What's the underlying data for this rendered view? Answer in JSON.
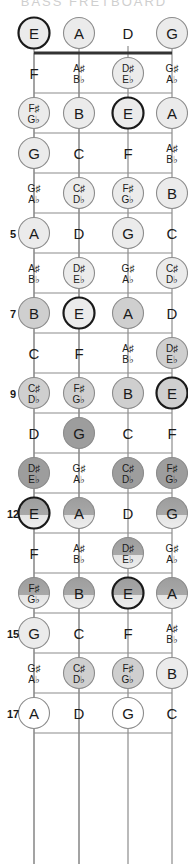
{
  "diagram": {
    "instrument": "4-string bass",
    "orientation": "vertical",
    "colors": {
      "background": "#ffffff",
      "fret_line": "#8c8c8c",
      "nut": "#333333",
      "string": "#8c8c8c",
      "text": "#1a1a1a",
      "circle_light": "#ebebeb",
      "circle_mid": "#cfcfcf",
      "circle_dark": "#9d9d9d",
      "circle_outline_strong": "#1a1a1a",
      "circle_outline_soft": "#8c8c8c"
    },
    "strings": [
      {
        "index": 0,
        "open_note": "E",
        "x": 34,
        "highlight": "strong"
      },
      {
        "index": 1,
        "open_note": "A",
        "x": 79,
        "highlight": "soft"
      },
      {
        "index": 2,
        "open_note": "D",
        "x": 128,
        "highlight": "none"
      },
      {
        "index": 3,
        "open_note": "G",
        "x": 172,
        "highlight": "soft"
      }
    ],
    "fret_markers": [
      "5",
      "7",
      "9",
      "12",
      "15",
      "17"
    ],
    "top_cut_label": "BASS FRETBOARD",
    "frets": [
      {
        "number": 0,
        "label": "",
        "y": 33,
        "notes": [
          {
            "string": 0,
            "text": "E",
            "sharp": "",
            "flat": "",
            "shade": "light",
            "ring": "strong"
          },
          {
            "string": 1,
            "text": "A",
            "sharp": "",
            "flat": "",
            "shade": "light",
            "ring": "soft"
          },
          {
            "string": 2,
            "text": "D",
            "sharp": "",
            "flat": "",
            "shade": "none",
            "ring": "none"
          },
          {
            "string": 3,
            "text": "G",
            "sharp": "",
            "flat": "",
            "shade": "light",
            "ring": "soft"
          }
        ]
      },
      {
        "number": 1,
        "label": "",
        "y": 73,
        "notes": [
          {
            "string": 0,
            "text": "F",
            "sharp": "",
            "flat": "",
            "shade": "none",
            "ring": "none"
          },
          {
            "string": 1,
            "text": "",
            "sharp": "A♯",
            "flat": "B♭",
            "shade": "none",
            "ring": "none"
          },
          {
            "string": 2,
            "text": "",
            "sharp": "D♯",
            "flat": "E♭",
            "shade": "light",
            "ring": "soft"
          },
          {
            "string": 3,
            "text": "",
            "sharp": "G♯",
            "flat": "A♭",
            "shade": "none",
            "ring": "none"
          }
        ]
      },
      {
        "number": 2,
        "label": "",
        "y": 113,
        "notes": [
          {
            "string": 0,
            "text": "",
            "sharp": "F♯",
            "flat": "G♭",
            "shade": "light",
            "ring": "soft"
          },
          {
            "string": 1,
            "text": "B",
            "sharp": "",
            "flat": "",
            "shade": "light",
            "ring": "soft"
          },
          {
            "string": 2,
            "text": "E",
            "sharp": "",
            "flat": "",
            "shade": "light",
            "ring": "strong"
          },
          {
            "string": 3,
            "text": "A",
            "sharp": "",
            "flat": "",
            "shade": "light",
            "ring": "soft"
          }
        ]
      },
      {
        "number": 3,
        "label": "",
        "y": 153,
        "notes": [
          {
            "string": 0,
            "text": "G",
            "sharp": "",
            "flat": "",
            "shade": "light",
            "ring": "soft"
          },
          {
            "string": 1,
            "text": "C",
            "sharp": "",
            "flat": "",
            "shade": "none",
            "ring": "none"
          },
          {
            "string": 2,
            "text": "F",
            "sharp": "",
            "flat": "",
            "shade": "none",
            "ring": "none"
          },
          {
            "string": 3,
            "text": "",
            "sharp": "A♯",
            "flat": "B♭",
            "shade": "none",
            "ring": "none"
          }
        ]
      },
      {
        "number": 4,
        "label": "",
        "y": 193,
        "notes": [
          {
            "string": 0,
            "text": "",
            "sharp": "G♯",
            "flat": "A♭",
            "shade": "none",
            "ring": "none"
          },
          {
            "string": 1,
            "text": "",
            "sharp": "C♯",
            "flat": "D♭",
            "shade": "light",
            "ring": "soft"
          },
          {
            "string": 2,
            "text": "",
            "sharp": "F♯",
            "flat": "G♭",
            "shade": "light",
            "ring": "soft"
          },
          {
            "string": 3,
            "text": "B",
            "sharp": "",
            "flat": "",
            "shade": "light",
            "ring": "soft"
          }
        ]
      },
      {
        "number": 5,
        "label": "5",
        "y": 233,
        "notes": [
          {
            "string": 0,
            "text": "A",
            "sharp": "",
            "flat": "",
            "shade": "light",
            "ring": "soft"
          },
          {
            "string": 1,
            "text": "D",
            "sharp": "",
            "flat": "",
            "shade": "none",
            "ring": "none"
          },
          {
            "string": 2,
            "text": "G",
            "sharp": "",
            "flat": "",
            "shade": "light",
            "ring": "soft"
          },
          {
            "string": 3,
            "text": "C",
            "sharp": "",
            "flat": "",
            "shade": "none",
            "ring": "none"
          }
        ]
      },
      {
        "number": 6,
        "label": "",
        "y": 273,
        "notes": [
          {
            "string": 0,
            "text": "",
            "sharp": "A♯",
            "flat": "B♭",
            "shade": "none",
            "ring": "none"
          },
          {
            "string": 1,
            "text": "",
            "sharp": "D♯",
            "flat": "E♭",
            "shade": "light",
            "ring": "soft"
          },
          {
            "string": 2,
            "text": "",
            "sharp": "G♯",
            "flat": "A♭",
            "shade": "none",
            "ring": "none"
          },
          {
            "string": 3,
            "text": "",
            "sharp": "C♯",
            "flat": "D♭",
            "shade": "light",
            "ring": "soft"
          }
        ]
      },
      {
        "number": 7,
        "label": "7",
        "y": 313,
        "notes": [
          {
            "string": 0,
            "text": "B",
            "sharp": "",
            "flat": "",
            "shade": "mid",
            "ring": "soft"
          },
          {
            "string": 1,
            "text": "E",
            "sharp": "",
            "flat": "",
            "shade": "light",
            "ring": "strong"
          },
          {
            "string": 2,
            "text": "A",
            "sharp": "",
            "flat": "",
            "shade": "mid",
            "ring": "soft"
          },
          {
            "string": 3,
            "text": "D",
            "sharp": "",
            "flat": "",
            "shade": "none",
            "ring": "none"
          }
        ]
      },
      {
        "number": 8,
        "label": "",
        "y": 353,
        "notes": [
          {
            "string": 0,
            "text": "C",
            "sharp": "",
            "flat": "",
            "shade": "none",
            "ring": "none"
          },
          {
            "string": 1,
            "text": "F",
            "sharp": "",
            "flat": "",
            "shade": "none",
            "ring": "none"
          },
          {
            "string": 2,
            "text": "",
            "sharp": "A♯",
            "flat": "B♭",
            "shade": "none",
            "ring": "none"
          },
          {
            "string": 3,
            "text": "",
            "sharp": "D♯",
            "flat": "E♭",
            "shade": "mid",
            "ring": "soft"
          }
        ]
      },
      {
        "number": 9,
        "label": "9",
        "y": 393,
        "notes": [
          {
            "string": 0,
            "text": "",
            "sharp": "C♯",
            "flat": "D♭",
            "shade": "mid",
            "ring": "soft"
          },
          {
            "string": 1,
            "text": "",
            "sharp": "F♯",
            "flat": "G♭",
            "shade": "mid",
            "ring": "soft"
          },
          {
            "string": 2,
            "text": "B",
            "sharp": "",
            "flat": "",
            "shade": "mid",
            "ring": "soft"
          },
          {
            "string": 3,
            "text": "E",
            "sharp": "",
            "flat": "",
            "shade": "mid",
            "ring": "strong"
          }
        ]
      },
      {
        "number": 10,
        "label": "",
        "y": 433,
        "notes": [
          {
            "string": 0,
            "text": "D",
            "sharp": "",
            "flat": "",
            "shade": "none",
            "ring": "none"
          },
          {
            "string": 1,
            "text": "G",
            "sharp": "",
            "flat": "",
            "shade": "dark",
            "ring": "soft"
          },
          {
            "string": 2,
            "text": "C",
            "sharp": "",
            "flat": "",
            "shade": "none",
            "ring": "none"
          },
          {
            "string": 3,
            "text": "F",
            "sharp": "",
            "flat": "",
            "shade": "none",
            "ring": "none"
          }
        ]
      },
      {
        "number": 11,
        "label": "",
        "y": 473,
        "notes": [
          {
            "string": 0,
            "text": "",
            "sharp": "D♯",
            "flat": "E♭",
            "shade": "dark",
            "ring": "soft"
          },
          {
            "string": 1,
            "text": "",
            "sharp": "G♯",
            "flat": "A♭",
            "shade": "none",
            "ring": "none"
          },
          {
            "string": 2,
            "text": "",
            "sharp": "C♯",
            "flat": "D♭",
            "shade": "dark",
            "ring": "soft"
          },
          {
            "string": 3,
            "text": "",
            "sharp": "F♯",
            "flat": "G♭",
            "shade": "dark",
            "ring": "soft"
          }
        ]
      },
      {
        "number": 12,
        "label": "12",
        "y": 513,
        "notes": [
          {
            "string": 0,
            "text": "E",
            "sharp": "",
            "flat": "",
            "shade": "grad",
            "ring": "strong"
          },
          {
            "string": 1,
            "text": "A",
            "sharp": "",
            "flat": "",
            "shade": "grad",
            "ring": "soft"
          },
          {
            "string": 2,
            "text": "D",
            "sharp": "",
            "flat": "",
            "shade": "none",
            "ring": "none"
          },
          {
            "string": 3,
            "text": "G",
            "sharp": "",
            "flat": "",
            "shade": "grad",
            "ring": "soft"
          }
        ]
      },
      {
        "number": 13,
        "label": "",
        "y": 553,
        "notes": [
          {
            "string": 0,
            "text": "F",
            "sharp": "",
            "flat": "",
            "shade": "none",
            "ring": "none"
          },
          {
            "string": 1,
            "text": "",
            "sharp": "A♯",
            "flat": "B♭",
            "shade": "none",
            "ring": "none"
          },
          {
            "string": 2,
            "text": "",
            "sharp": "D♯",
            "flat": "E♭",
            "shade": "grad",
            "ring": "soft"
          },
          {
            "string": 3,
            "text": "",
            "sharp": "G♯",
            "flat": "A♭",
            "shade": "none",
            "ring": "none"
          }
        ]
      },
      {
        "number": 14,
        "label": "",
        "y": 593,
        "notes": [
          {
            "string": 0,
            "text": "",
            "sharp": "F♯",
            "flat": "G♭",
            "shade": "grad",
            "ring": "soft"
          },
          {
            "string": 1,
            "text": "B",
            "sharp": "",
            "flat": "",
            "shade": "grad",
            "ring": "soft"
          },
          {
            "string": 2,
            "text": "E",
            "sharp": "",
            "flat": "",
            "shade": "grad",
            "ring": "strong"
          },
          {
            "string": 3,
            "text": "A",
            "sharp": "",
            "flat": "",
            "shade": "grad",
            "ring": "soft"
          }
        ]
      },
      {
        "number": 15,
        "label": "15",
        "y": 633,
        "notes": [
          {
            "string": 0,
            "text": "G",
            "sharp": "",
            "flat": "",
            "shade": "light",
            "ring": "soft"
          },
          {
            "string": 1,
            "text": "C",
            "sharp": "",
            "flat": "",
            "shade": "none",
            "ring": "none"
          },
          {
            "string": 2,
            "text": "F",
            "sharp": "",
            "flat": "",
            "shade": "none",
            "ring": "none"
          },
          {
            "string": 3,
            "text": "",
            "sharp": "A♯",
            "flat": "B♭",
            "shade": "none",
            "ring": "none"
          }
        ]
      },
      {
        "number": 16,
        "label": "",
        "y": 673,
        "notes": [
          {
            "string": 0,
            "text": "",
            "sharp": "G♯",
            "flat": "A♭",
            "shade": "none",
            "ring": "none"
          },
          {
            "string": 1,
            "text": "",
            "sharp": "C♯",
            "flat": "D♭",
            "shade": "mid",
            "ring": "soft"
          },
          {
            "string": 2,
            "text": "",
            "sharp": "F♯",
            "flat": "G♭",
            "shade": "mid",
            "ring": "soft"
          },
          {
            "string": 3,
            "text": "B",
            "sharp": "",
            "flat": "",
            "shade": "light",
            "ring": "soft"
          }
        ]
      },
      {
        "number": 17,
        "label": "17",
        "y": 713,
        "notes": [
          {
            "string": 0,
            "text": "A",
            "sharp": "",
            "flat": "",
            "shade": "white",
            "ring": "soft"
          },
          {
            "string": 1,
            "text": "D",
            "sharp": "",
            "flat": "",
            "shade": "none",
            "ring": "none"
          },
          {
            "string": 2,
            "text": "G",
            "sharp": "",
            "flat": "",
            "shade": "white",
            "ring": "soft"
          },
          {
            "string": 3,
            "text": "C",
            "sharp": "",
            "flat": "",
            "shade": "none",
            "ring": "none"
          }
        ]
      }
    ]
  }
}
